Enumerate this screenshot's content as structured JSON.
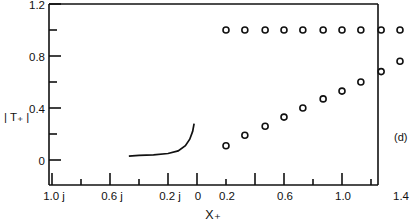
{
  "figure": {
    "panel_label": "(d)",
    "axis_color": "#111111",
    "marker_color": "#111111",
    "curve_color": "#111111",
    "background": "#ffffff"
  },
  "chart_data": {
    "type": "scatter",
    "title": "",
    "xlabel": "X₊",
    "ylabel": "| T₊ |",
    "xlim": [
      -1.2,
      1.5
    ],
    "ylim": [
      0,
      1.2
    ],
    "grid": false,
    "legend": "none",
    "x_tick_labels": [
      "1.0 j",
      "0.6 j",
      "0.2 j",
      "0",
      "0.2",
      "0.6",
      "1.0",
      "1.4"
    ],
    "x_tick_values": [
      -1.0,
      -0.6,
      -0.2,
      0.0,
      0.2,
      0.6,
      1.0,
      1.4
    ],
    "x_minor_tick_values": [
      -1.2,
      -0.8,
      -0.4,
      0.4,
      0.8,
      1.2
    ],
    "y_tick_labels": [
      "0",
      "0.4",
      "0.8",
      "1.2"
    ],
    "y_tick_values": [
      0,
      0.4,
      0.8,
      1.2
    ],
    "y_minor_tick_values": [
      0.2,
      0.6,
      1.0
    ],
    "series": [
      {
        "name": "upper-branch-circles",
        "marker": "open-circle",
        "x": [
          0.2,
          0.33,
          0.47,
          0.6,
          0.73,
          0.87,
          1.0,
          1.13,
          1.27,
          1.4
        ],
        "y": [
          1.0,
          1.0,
          1.0,
          1.0,
          1.0,
          1.0,
          1.0,
          1.0,
          1.0,
          1.0
        ]
      },
      {
        "name": "lower-branch-circles",
        "marker": "open-circle",
        "x": [
          0.2,
          0.33,
          0.47,
          0.6,
          0.73,
          0.87,
          1.0,
          1.13,
          1.27,
          1.4
        ],
        "y": [
          0.11,
          0.19,
          0.26,
          0.33,
          0.4,
          0.47,
          0.53,
          0.6,
          0.68,
          0.76
        ]
      },
      {
        "name": "solid-curve",
        "marker": "line",
        "x": [
          -0.47,
          -0.4,
          -0.3,
          -0.2,
          -0.13,
          -0.08,
          -0.05,
          -0.03,
          -0.02
        ],
        "y": [
          0.03,
          0.035,
          0.04,
          0.05,
          0.07,
          0.11,
          0.16,
          0.22,
          0.28
        ]
      }
    ]
  }
}
